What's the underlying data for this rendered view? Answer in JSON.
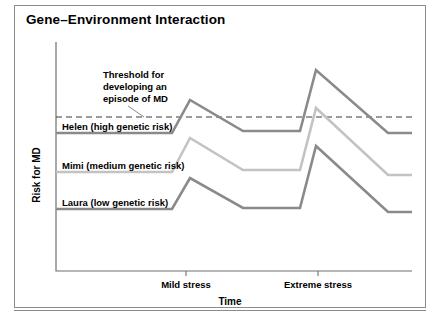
{
  "figure": {
    "title": "Gene–Environment Interaction"
  },
  "chart_data": {
    "type": "line",
    "title": "Gene–Environment Interaction",
    "xlabel": "Time",
    "ylabel": "Risk for MD",
    "grid": false,
    "legend_position": "inline-left-of-series",
    "x_tick_labels": [
      "Mild stress",
      "Extreme stress"
    ],
    "x_tick_positions": [
      186,
      318
    ],
    "axis_pixel_box": {
      "left": 56,
      "right": 412,
      "top": 42,
      "bottom": 271
    },
    "threshold": {
      "label": "Threshold for developing an episode of MD",
      "label_lines": [
        "Threshold for",
        "developing an",
        "episode of MD"
      ],
      "y_pixel": 117,
      "style": "dashed"
    },
    "series": [
      {
        "name": "Helen (high genetic risk)",
        "risk_level": "high genetic risk",
        "person": "Helen",
        "color": "#8a8a8a",
        "label_x": 62,
        "label_y": 130,
        "points": [
          {
            "x": 56,
            "y": 133
          },
          {
            "x": 172,
            "y": 133
          },
          {
            "x": 190,
            "y": 100
          },
          {
            "x": 243,
            "y": 131
          },
          {
            "x": 300,
            "y": 131
          },
          {
            "x": 316,
            "y": 70
          },
          {
            "x": 388,
            "y": 133
          },
          {
            "x": 412,
            "y": 133
          }
        ]
      },
      {
        "name": "Mimi (medium genetic risk)",
        "risk_level": "medium genetic risk",
        "person": "Mimi",
        "color": "#c3c3c3",
        "label_x": 62,
        "label_y": 169,
        "points": [
          {
            "x": 56,
            "y": 172
          },
          {
            "x": 172,
            "y": 172
          },
          {
            "x": 190,
            "y": 138
          },
          {
            "x": 243,
            "y": 170
          },
          {
            "x": 300,
            "y": 170
          },
          {
            "x": 316,
            "y": 108
          },
          {
            "x": 388,
            "y": 175
          },
          {
            "x": 412,
            "y": 175
          }
        ]
      },
      {
        "name": "Laura (low genetic risk)",
        "risk_level": "low genetic risk",
        "person": "Laura",
        "color": "#8a8a8a",
        "label_x": 62,
        "label_y": 206,
        "points": [
          {
            "x": 56,
            "y": 209
          },
          {
            "x": 172,
            "y": 209
          },
          {
            "x": 190,
            "y": 178
          },
          {
            "x": 243,
            "y": 208
          },
          {
            "x": 300,
            "y": 208
          },
          {
            "x": 316,
            "y": 146
          },
          {
            "x": 388,
            "y": 212
          },
          {
            "x": 412,
            "y": 212
          }
        ]
      }
    ]
  }
}
